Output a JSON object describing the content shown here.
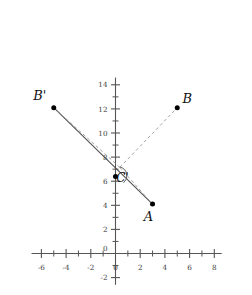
{
  "chart_data": {
    "type": "scatter",
    "title": "",
    "xlabel": "",
    "ylabel": "",
    "xlim": [
      -6.8,
      8.6
    ],
    "ylim": [
      -2.6,
      14.6
    ],
    "grid": false,
    "legend": null,
    "axis": {
      "x_ticks_major": [
        -6,
        -4,
        -2,
        0,
        2,
        4,
        6,
        8
      ],
      "x_ticks_minor": [
        -5,
        -3,
        -1,
        1,
        3,
        5,
        7
      ],
      "x_tick_labels": [
        "-6",
        "-4",
        "-2",
        "0",
        "2",
        "4",
        "6",
        "8"
      ],
      "y_ticks_major": [
        -2,
        0,
        2,
        4,
        6,
        8,
        10,
        12,
        14
      ],
      "y_ticks_minor": [
        -1,
        1,
        3,
        5,
        7,
        9,
        11,
        13
      ],
      "y_tick_labels": [
        "-2",
        "0",
        "2",
        "4",
        "6",
        "8",
        "10",
        "12",
        "14"
      ],
      "zero_label": "0"
    },
    "points": [
      {
        "name": "A",
        "label": "A",
        "x": 3,
        "y": 4.1,
        "label_dx": -4,
        "label_dy": 17
      },
      {
        "name": "B",
        "label": "B",
        "x": 5,
        "y": 12.1,
        "label_dx": 10,
        "label_dy": -5
      },
      {
        "name": "Bp",
        "label": "B'",
        "x": -5,
        "y": 12.1,
        "label_dx": -14,
        "label_dy": -8
      },
      {
        "name": "Cp",
        "label": "C'",
        "x": 0,
        "y": 6.4,
        "label_dx": 7,
        "label_dy": 6
      }
    ],
    "segments": [
      {
        "name": "bprime-to-a-solid",
        "style": "solid",
        "from": [
          -5,
          12.1
        ],
        "to": [
          3,
          4.1
        ]
      },
      {
        "name": "c-to-b-dashed",
        "style": "dashed",
        "from": [
          0.35,
          7.15
        ],
        "to": [
          5,
          12.1
        ]
      },
      {
        "name": "c-to-bprime-dashed",
        "style": "dashed",
        "from": [
          0.35,
          7.15
        ],
        "to": [
          -5,
          12.1
        ]
      },
      {
        "name": "c-to-a-dashed",
        "style": "dashed",
        "from": [
          0.35,
          7.15
        ],
        "to": [
          3,
          4.1
        ]
      }
    ],
    "angle_arc": {
      "name": "angle-at-cprime",
      "cx": 0.2,
      "cy": 6.45,
      "r": 9
    }
  },
  "labels": {
    "a": "A",
    "b": "B",
    "b_prime": "B'",
    "c_prime": "C'"
  },
  "colors": {
    "axis": "#555555",
    "solid_line": "#4d4d4d",
    "dashed_line": "#9a9a9a",
    "point": "#000000",
    "text": "#111111",
    "background": "#ffffff"
  }
}
